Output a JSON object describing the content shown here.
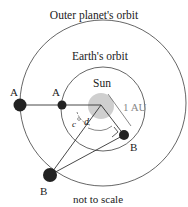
{
  "diagram": {
    "labels": {
      "outer_orbit": "Outer planet's orbit",
      "earth_orbit": "Earth's orbit",
      "sun": "Sun",
      "distance": "1 AU",
      "note": "not to scale",
      "outer_A": "A",
      "earth_A": "A",
      "earth_B": "B",
      "outer_B": "B",
      "angle_c": "c",
      "angle_d": "d"
    },
    "colors": {
      "orbit": "#555555",
      "sun": "#c8c8c8",
      "planet": "#222222",
      "label_gray": "#888888"
    }
  }
}
